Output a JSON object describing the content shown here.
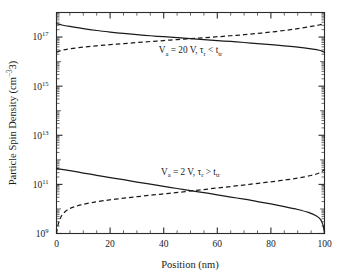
{
  "chart_data": {
    "type": "line",
    "title": "",
    "xlabel": "Position (nm)",
    "ylabel": "Particle Spin Density (cm−3)",
    "xlim": [
      0,
      100
    ],
    "ylim": [
      1000000000.0,
      1e+18
    ],
    "yscale": "log",
    "xscale": "linear",
    "grid": false,
    "legend": "none",
    "xticks": [
      0,
      20,
      40,
      60,
      80,
      100
    ],
    "xticklabels": [
      "0",
      "20",
      "40",
      "60",
      "80",
      "100"
    ],
    "yticks": [
      1000000000.0,
      100000000000.0,
      10000000000000.0,
      1000000000000000.0,
      1e+17
    ],
    "yticklabels": [
      "10",
      "10",
      "10",
      "10",
      "10"
    ],
    "ytick_exponents": [
      "9",
      "11",
      "13",
      "15",
      "17"
    ],
    "series": [
      {
        "name": "Va = 20 V, tau_r < t_tr (spin up, solid)",
        "style": "solid",
        "x": [
          0,
          2,
          5,
          10,
          15,
          20,
          25,
          30,
          35,
          40,
          45,
          50,
          55,
          60,
          65,
          70,
          75,
          80,
          85,
          90,
          95,
          98,
          100
        ],
        "y": [
          3.5e+17,
          3.1e+17,
          2.7e+17,
          2.2e+17,
          1.85e+17,
          1.6e+17,
          1.4e+17,
          1.25e+17,
          1.13e+17,
          1.03e+17,
          9.4e+16,
          8.6e+16,
          7.9e+16,
          7.2e+16,
          6.6e+16,
          6e+16,
          5.4e+16,
          4.9e+16,
          4.4e+16,
          3.9e+16,
          3.3e+16,
          2.9e+16,
          2.4e+16
        ]
      },
      {
        "name": "Va = 20 V, tau_r < t_tr (spin down, dashed)",
        "style": "dashed",
        "x": [
          0,
          2,
          5,
          10,
          15,
          20,
          25,
          30,
          35,
          40,
          45,
          50,
          55,
          60,
          65,
          70,
          75,
          80,
          85,
          90,
          95,
          98,
          100
        ],
        "y": [
          2.4e+16,
          2.9e+16,
          3.3e+16,
          3.9e+16,
          4.4e+16,
          4.9e+16,
          5.4e+16,
          6e+16,
          6.6e+16,
          7.2e+16,
          7.9e+16,
          8.6e+16,
          9.4e+16,
          1.03e+17,
          1.13e+17,
          1.25e+17,
          1.4e+17,
          1.6e+17,
          1.85e+17,
          2.2e+17,
          2.7e+17,
          3.1e+17,
          3.5e+17
        ]
      },
      {
        "name": "Va = 2 V, tau_r > t_tr (spin up, solid)",
        "style": "solid",
        "x": [
          0,
          2,
          5,
          10,
          15,
          20,
          25,
          30,
          35,
          40,
          45,
          50,
          55,
          60,
          65,
          70,
          75,
          80,
          85,
          90,
          94,
          97,
          98.5,
          99.4,
          99.8,
          100
        ],
        "y": [
          450000000000.0,
          410000000000.0,
          360000000000.0,
          290000000000.0,
          235000000000.0,
          190000000000.0,
          155000000000.0,
          125000000000.0,
          102000000000.0,
          83000000000.0,
          68000000000.0,
          56000000000.0,
          46000000000.0,
          37500000000.0,
          30500000000.0,
          25000000000.0,
          20000000000.0,
          16000000000.0,
          12500000000.0,
          9500000000.0,
          7200000000.0,
          5200000000.0,
          3800000000.0,
          2300000000.0,
          1400000000.0,
          1000000000.0
        ]
      },
      {
        "name": "Va = 2 V, tau_r > t_tr (spin down, dashed)",
        "style": "dashed",
        "x": [
          0,
          0.2,
          0.6,
          1.0,
          1.6,
          2.5,
          4,
          6,
          9,
          13,
          18,
          24,
          30,
          36,
          42,
          48,
          54,
          60,
          66,
          72,
          78,
          84,
          90,
          95,
          98,
          100
        ],
        "y": [
          1000000000.0,
          1400000000.0,
          2300000000.0,
          3200000000.0,
          4600000000.0,
          6500000000.0,
          9000000000.0,
          11500000000.0,
          14500000000.0,
          18000000000.0,
          22000000000.0,
          26500000000.0,
          31500000000.0,
          37000000000.0,
          43000000000.0,
          51000000000.0,
          60000000000.0,
          71000000000.0,
          84000000000.0,
          100000000000.0,
          120000000000.0,
          145000000000.0,
          180000000000.0,
          230000000000.0,
          290000000000.0,
          400000000000.0
        ]
      }
    ],
    "annotations": [
      {
        "id": "high-bias",
        "text_pre": "V",
        "text_sub1": "a",
        "text_mid": " = 20 V, τ",
        "text_sub2": "r",
        "text_mid2": " < t",
        "text_sub3": "tr",
        "x": 50,
        "y": 2.2e+16
      },
      {
        "id": "low-bias",
        "text_pre": "V",
        "text_sub1": "a",
        "text_mid": " = 2 V, τ",
        "text_sub2": "r",
        "text_mid2": " > t",
        "text_sub3": "tr",
        "x": 50,
        "y": 250000000000.0
      }
    ]
  },
  "figure": {
    "background_color": "#ffffff",
    "line_color": "#1a1a1a",
    "axis_color": "#2b2b2b"
  }
}
